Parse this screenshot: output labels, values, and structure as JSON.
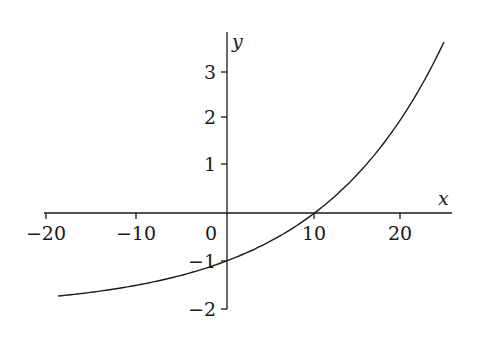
{
  "chart_data": {
    "type": "line",
    "title": "",
    "xlabel": "x",
    "ylabel": "y",
    "function": "y = 2^(x/10) - 2",
    "x_ticks": [
      -20,
      -10,
      0,
      10,
      20
    ],
    "x_tick_labels": [
      "−20",
      "−10",
      "0",
      "10",
      "20"
    ],
    "y_ticks": [
      -2,
      -1,
      1,
      2,
      3
    ],
    "y_tick_labels": [
      "−2",
      "−1",
      "1",
      "2",
      "3"
    ],
    "xlim": [
      -20,
      26
    ],
    "ylim": [
      -2,
      3.8
    ],
    "grid": false,
    "legend": null,
    "series": [
      {
        "name": "curve",
        "x": [
          -19.3,
          -15,
          -10,
          -5,
          0,
          5,
          10,
          15,
          20,
          24.8
        ],
        "y": [
          -1.74,
          -1.65,
          -1.5,
          -1.29,
          -1.0,
          -0.59,
          0.0,
          0.83,
          2.0,
          3.58
        ]
      }
    ]
  },
  "axes": {
    "x_label": "x",
    "y_label": "y",
    "origin_label": "0"
  }
}
